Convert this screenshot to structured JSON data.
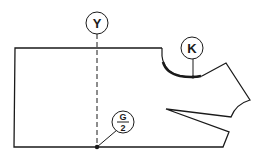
{
  "diagram": {
    "type": "garment-pattern-draft",
    "labels": {
      "y_marker": "Y",
      "k_marker": "K",
      "g_numerator": "G",
      "g_denominator": "2"
    },
    "colors": {
      "line": "#1a1a1a",
      "background": "#ffffff"
    }
  }
}
